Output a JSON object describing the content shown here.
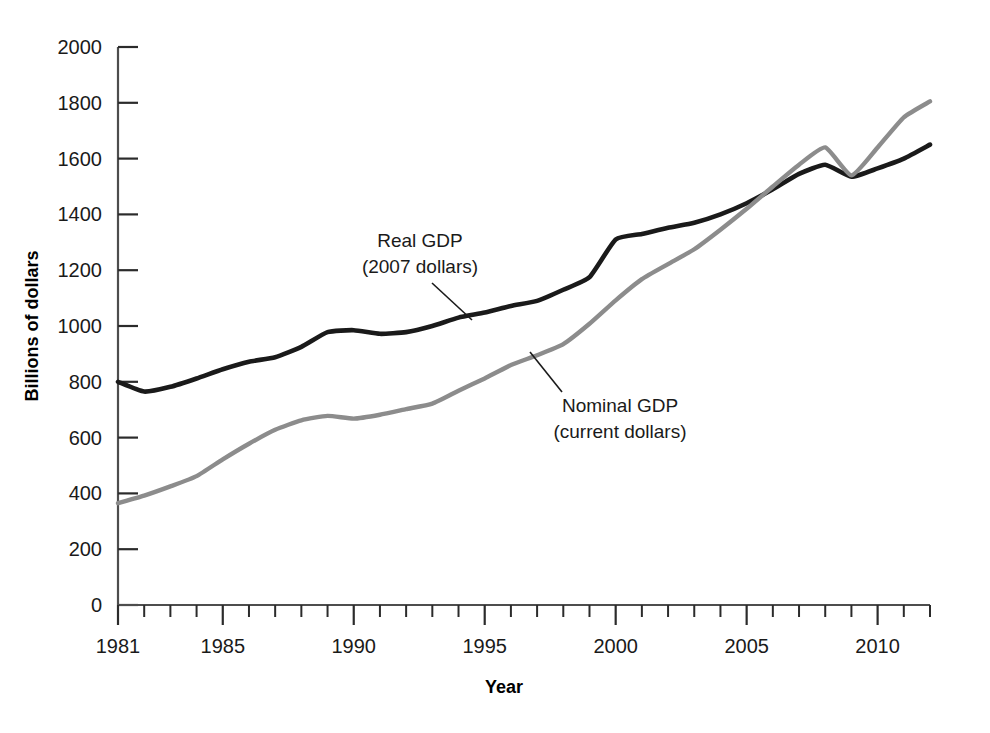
{
  "chart_data": {
    "type": "line",
    "title": "",
    "xlabel": "Year",
    "ylabel": "Billions of dollars",
    "x": [
      1981,
      1982,
      1983,
      1984,
      1985,
      1986,
      1987,
      1988,
      1989,
      1990,
      1991,
      1992,
      1993,
      1994,
      1995,
      1996,
      1997,
      1998,
      1999,
      2000,
      2001,
      2002,
      2003,
      2004,
      2005,
      2006,
      2007,
      2008,
      2009,
      2010,
      2011,
      2012
    ],
    "xlim": [
      1981,
      2012
    ],
    "ylim": [
      0,
      2000
    ],
    "yticks": [
      0,
      200,
      400,
      600,
      800,
      1000,
      1200,
      1400,
      1600,
      1800,
      2000
    ],
    "xticks_labeled": [
      1981,
      1985,
      1990,
      1995,
      2000,
      2005,
      2010
    ],
    "xtick_labels": [
      "1981",
      "1985",
      "1990",
      "1995",
      "2000",
      "2005",
      "2010"
    ],
    "ytick_labels": [
      "0",
      "200",
      "400",
      "600",
      "800",
      "1000",
      "1200",
      "1400",
      "1600",
      "1800",
      "2000"
    ],
    "grid": false,
    "legend_position": "inline-annotations",
    "series": [
      {
        "name": "Real GDP",
        "sublabel": "(2007 dollars)",
        "annotation_line1": "Real GDP",
        "annotation_line2": "(2007 dollars)",
        "color": "#1a1a1a",
        "values": [
          800,
          765,
          782,
          812,
          845,
          872,
          888,
          925,
          978,
          985,
          972,
          978,
          1000,
          1030,
          1048,
          1072,
          1090,
          1130,
          1175,
          1310,
          1330,
          1352,
          1370,
          1400,
          1440,
          1490,
          1545,
          1578,
          1535,
          1565,
          1600,
          1650
        ]
      },
      {
        "name": "Nominal GDP",
        "sublabel": "(current dollars)",
        "annotation_line1": "Nominal GDP",
        "annotation_line2": "(current dollars)",
        "color": "#8c8c8c",
        "values": [
          365,
          392,
          425,
          462,
          522,
          578,
          628,
          662,
          678,
          668,
          682,
          702,
          722,
          768,
          812,
          860,
          895,
          935,
          1008,
          1092,
          1168,
          1222,
          1275,
          1345,
          1420,
          1500,
          1578,
          1640,
          1540,
          1640,
          1748,
          1805
        ]
      }
    ],
    "annotations": [
      {
        "text_line1": "Real GDP",
        "text_line2": "(2007 dollars)",
        "leader_from_x": 420,
        "leader_from_y": 258,
        "leader_to_x": 470,
        "leader_to_y": 318
      },
      {
        "text_line1": "Nominal GDP",
        "text_line2": "(current dollars)",
        "leader_from_x": 578,
        "leader_from_y": 392,
        "leader_to_x": 540,
        "leader_to_y": 350
      }
    ]
  },
  "colors": {
    "real_gdp": "#1a1a1a",
    "nominal_gdp": "#8c8c8c",
    "axis": "#4d4d4d",
    "background": "#ffffff"
  }
}
